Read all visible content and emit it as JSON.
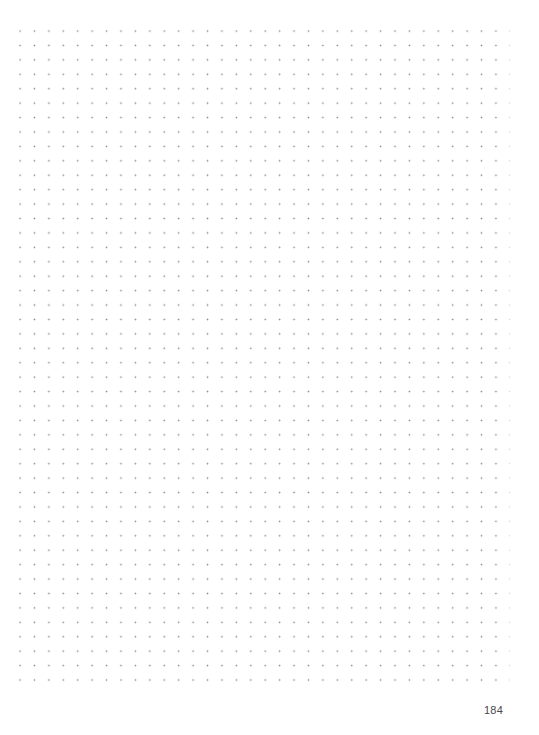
{
  "page": {
    "type": "dot-grid notebook page",
    "page_number": "184",
    "grid": {
      "columns": 34,
      "rows": 46,
      "spacing_px": 14.4,
      "dot_color": "#8a8a8a"
    },
    "colors": {
      "background": "#ffffff",
      "page_number": "#4a4a4a"
    }
  }
}
